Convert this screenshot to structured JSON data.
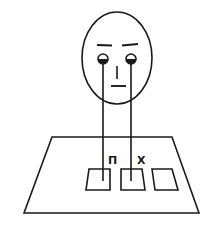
{
  "figure": {
    "labels": {
      "left_label": "П",
      "right_label": "X"
    },
    "colors": {
      "ink": "#1a1a1a",
      "background": "#ffffff"
    }
  }
}
